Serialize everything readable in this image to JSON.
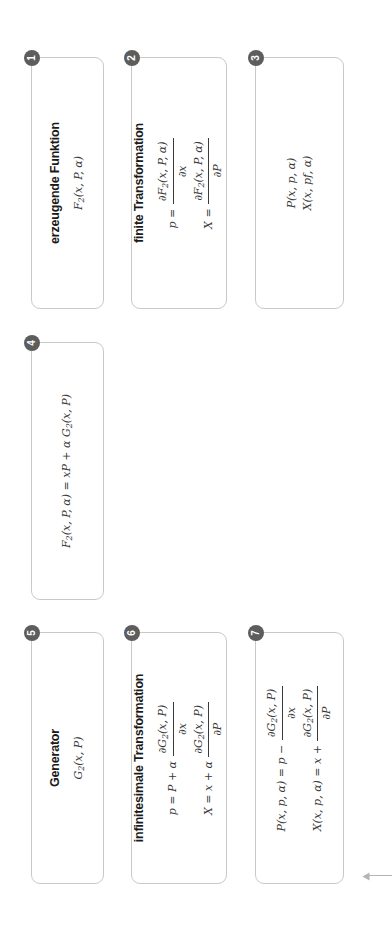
{
  "diagram": {
    "orientation": "rotated-90-ccw",
    "accent_badge_color": "#5d5d5d",
    "box_border_color": "#c9c9c9",
    "connector_color": "#b4b4b4",
    "nodes": [
      {
        "id": "n1",
        "badge": "1",
        "title": "erzeugende Funktion",
        "lines": [
          "F2(x, P, α)"
        ]
      },
      {
        "id": "n2",
        "badge": "2",
        "title": "finite Transformation",
        "lines": [
          "p = ∂F2(x, P, α) / ∂x",
          "X = ∂F2(x, P, α) / ∂P"
        ]
      },
      {
        "id": "n3",
        "badge": "3",
        "title": "",
        "lines": [
          "P(x, p, α)",
          "X(x, pf, α)"
        ]
      },
      {
        "id": "n4",
        "badge": "4",
        "title": "",
        "lines": [
          "F2(x, P, α) = xP + α G2(x, P)"
        ]
      },
      {
        "id": "n5",
        "badge": "5",
        "title": "Generator",
        "lines": [
          "G2(x, P)"
        ]
      },
      {
        "id": "n6",
        "badge": "6",
        "title": "infinitesimale Transformation",
        "lines": [
          "p = P + α ∂G2(x, P) / ∂x",
          "X = x + α ∂G2(x, P) / ∂P"
        ]
      },
      {
        "id": "n7",
        "badge": "7",
        "title": "",
        "lines": [
          "P(x, p, α) = p − α ∂G2(x, P) / ∂x",
          "X(x, p, α) = x + α ∂G2(x, P) / ∂P"
        ]
      }
    ],
    "labels": {
      "n1_title": "erzeugende Funktion",
      "n2_title": "finite Transformation",
      "n5_title": "Generator",
      "n6_title": "infinitesimale Transformation",
      "badge1": "1",
      "badge2": "2",
      "badge3": "3",
      "badge4": "4",
      "badge5": "5",
      "badge6": "6",
      "badge7": "7"
    },
    "math": {
      "F2": "F",
      "F2sub": "2",
      "G2": "G",
      "G2sub": "2",
      "alpha": "α",
      "partial": "∂",
      "n1_expr": "(x, P, α)",
      "n2_lhs1": "p =",
      "n2_lhs2": "X =",
      "n2_num1": "(x, P, α)",
      "n2_den1": "x",
      "n2_num2": "(x, P, α)",
      "n2_den2": "P",
      "n3_line1": "P(x, p, α)",
      "n3_line2": "X(x, pf, α)",
      "n4_lhs": "(x, P, α) = xP +",
      "n4_rhs": "(x, P)",
      "n5_expr": "(x, P)",
      "n6_lhs1": "p = P +",
      "n6_lhs2": "X = x +",
      "n6_num": "(x, P)",
      "n6_den1": "x",
      "n6_den2": "P",
      "n7_lhs1": "P(x, p, α) = p −",
      "n7_lhs2": "X(x, p, α) = x +",
      "n7_num": "(x, P)",
      "n7_den1": "x",
      "n7_den2": "P"
    }
  }
}
